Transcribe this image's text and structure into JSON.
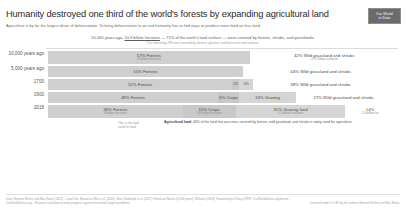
{
  "header": {
    "title": "Humanity destroyed one third of the world's forests by expanding agricultural land",
    "subtitle": "Agriculture is by far the largest driver of deforestation. To bring deforestation to an end humanity has to find ways to produce more food on less land.",
    "logo_line1": "Our World",
    "logo_line2": "in Data"
  },
  "intro": {
    "main_before": "10,000 years ago, ",
    "main_underline": "10.6 billion hectares",
    "main_after": " — 71% of the earth's land surface — were covered by forests, shrubs, and grasslands.",
    "sub": "The remaining 29% was covered by deserts, glaciers, and bare rock and surfaces."
  },
  "annotation": {
    "left_line1": "This is the land",
    "left_line2": "used for food",
    "bold": "Agricultural land:",
    "text": " 46% of the land that was once covered by forests, wild grassland, and shrubs is today used for agriculture."
  },
  "footer": {
    "left": "Data: Hannah Ritchie and Max Roser (2021) – Land Use. Based on Ellis et al. (2020); Klein Goldewijk et al. (2017); Historical Nature (4,500 years); Williams (2003); Ramankutty & Foley (1999). OurWorldInData.org/forests",
    "left2": "OurWorldInData.org – Research and data to make progress against the world's largest problems.",
    "right": "Licensed under CC-BY by the authors Hannah Ritchie and Max Roser."
  },
  "chart_data": {
    "type": "bar",
    "orientation": "horizontal-stacked",
    "xlabel": "",
    "ylabel": "",
    "xlim": [
      0,
      100
    ],
    "grid": false,
    "legend": "none",
    "categories": [
      "10,000 years ago",
      "5,000 years ago",
      "1700",
      "1900",
      "2018"
    ],
    "colors": {
      "forest": "#cfcfcf",
      "crops": "#c8c8c8",
      "grazing": "#d5d5d5",
      "wild": "#f2f2f2",
      "accent": "#6b6b6b"
    },
    "rows": [
      {
        "label": "10,000 years ago",
        "segments": [
          {
            "key": "forest",
            "value": 57,
            "label": "57% Forests",
            "sublabel": "6 billion hectares",
            "inside": true
          },
          {
            "key": "wild",
            "value": 42,
            "label": "42% Wild grassland and shrubs",
            "sublabel": "+1% Urban surfaces",
            "inside": false
          }
        ]
      },
      {
        "label": "5,000 years ago",
        "segments": [
          {
            "key": "forest",
            "value": 55,
            "label": "55% Forests",
            "sublabel": "",
            "inside": true
          },
          {
            "key": "wild",
            "value": 44,
            "label": "44% Wild grassland and shrubs",
            "sublabel": "",
            "inside": false
          }
        ]
      },
      {
        "label": "1700",
        "segments": [
          {
            "key": "forest",
            "value": 52,
            "label": "52% Forests",
            "sublabel": "",
            "inside": true
          },
          {
            "key": "crops",
            "value": 2,
            "label": "2%",
            "sublabel": "",
            "inside": true
          },
          {
            "key": "grazing",
            "value": 4,
            "label": "4%",
            "sublabel": "",
            "inside": true
          },
          {
            "key": "wild",
            "value": 38,
            "label": "38% Wild grassland and shrubs",
            "sublabel": "",
            "inside": false
          }
        ]
      },
      {
        "label": "1900",
        "segments": [
          {
            "key": "forest",
            "value": 48,
            "label": "48% Forests",
            "sublabel": "",
            "inside": true
          },
          {
            "key": "crops",
            "value": 6,
            "label": "6% Crops",
            "sublabel": "",
            "inside": true
          },
          {
            "key": "grazing",
            "value": 16,
            "label": "16% Grazing",
            "sublabel": "",
            "inside": true
          },
          {
            "key": "wild",
            "value": 27,
            "label": "27% Wild grassland and shrubs",
            "sublabel": "",
            "inside": false
          }
        ]
      },
      {
        "label": "2018",
        "segments": [
          {
            "key": "forest",
            "value": 38,
            "label": "38% Forests",
            "sublabel": "4 billion hectares",
            "inside": true
          },
          {
            "key": "crops",
            "value": 15,
            "label": "15% Crops",
            "sublabel": "1.6 billion hectares",
            "inside": true
          },
          {
            "key": "grazing",
            "value": 31,
            "label": "31% Grazing land",
            "sublabel": "3.2 billion hectares",
            "inside": true
          },
          {
            "key": "wild",
            "value": 14,
            "label": "14%",
            "sublabel": "1.4 billion ha",
            "inside": false
          }
        ]
      }
    ]
  }
}
